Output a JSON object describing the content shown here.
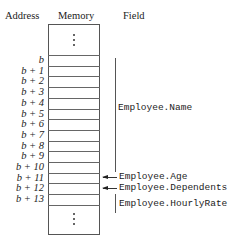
{
  "headers": {
    "address": "Address",
    "memory": "Memory",
    "field": "Field"
  },
  "addresses": [
    "b",
    "b + 1",
    "b + 2",
    "b + 3",
    "b + 4",
    "b + 5",
    "b + 6",
    "b + 7",
    "b + 8",
    "b + 9",
    "b + 10",
    "b + 11",
    "b + 12",
    "b + 13"
  ],
  "fields": {
    "name": "Employee.Name",
    "age": "Employee.Age",
    "dependents": "Employee.Dependents",
    "hourly_rate": "Employee.HourlyRate"
  },
  "continuation": {
    "top": "⋮",
    "bottom": "⋮"
  }
}
